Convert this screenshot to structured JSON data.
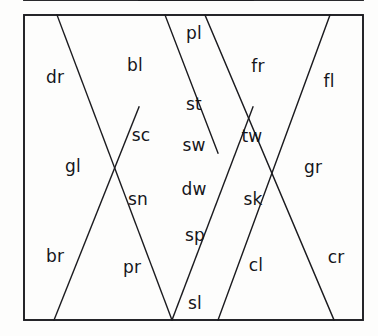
{
  "diagram": {
    "type": "line-lattice",
    "background_color": "#fdfdfc",
    "stroke_color": "#1b1b1f",
    "text_color": "#15151a",
    "frame": {
      "x": 24,
      "y": 15,
      "width": 339,
      "height": 305
    },
    "horizontal_rules": [
      {
        "name": "upper-band-divider",
        "y": 118,
        "x1": 24,
        "x2": 363
      },
      {
        "name": "lower-band-divider",
        "y": 213,
        "x1": 24,
        "x2": 363
      },
      {
        "name": "center-short-divider",
        "y": 166,
        "x1": 139,
        "x2": 253
      }
    ],
    "diagonals": [
      {
        "name": "diag-dr-bl",
        "x1": 57,
        "y1": 15,
        "x2": 172,
        "y2": 320
      },
      {
        "name": "diag-pl-st",
        "x1": 165,
        "y1": 15,
        "x2": 218,
        "y2": 153
      },
      {
        "name": "diag-sc-sn",
        "x1": 139,
        "y1": 107,
        "x2": 54,
        "y2": 320
      },
      {
        "name": "diag-fr-fl",
        "x1": 330,
        "y1": 15,
        "x2": 218,
        "y2": 320
      },
      {
        "name": "diag-tw-sk",
        "x1": 205,
        "y1": 15,
        "x2": 334,
        "y2": 320
      },
      {
        "name": "diag-sp-sl",
        "x1": 172,
        "y1": 320,
        "x2": 253,
        "y2": 107
      }
    ],
    "crossings": [
      {
        "name": "crossing-top",
        "x": 195,
        "y": 68
      },
      {
        "name": "crossing-left",
        "x": 139,
        "y": 166
      },
      {
        "name": "crossing-right",
        "x": 253,
        "y": 166
      },
      {
        "name": "crossing-bottom",
        "x": 195,
        "y": 265
      }
    ],
    "labels": [
      {
        "name": "cell-label-dr",
        "text": "dr",
        "x": 55,
        "y": 77,
        "size": 17
      },
      {
        "name": "cell-label-bl",
        "text": "bl",
        "x": 135,
        "y": 65,
        "size": 17
      },
      {
        "name": "cell-label-pl",
        "text": "pl",
        "x": 194,
        "y": 33,
        "size": 17
      },
      {
        "name": "cell-label-fr",
        "text": "fr",
        "x": 258,
        "y": 66,
        "size": 17
      },
      {
        "name": "cell-label-fl",
        "text": "fl",
        "x": 329,
        "y": 81,
        "size": 17
      },
      {
        "name": "cell-label-st",
        "text": "st",
        "x": 194,
        "y": 104,
        "size": 17
      },
      {
        "name": "cell-label-sc",
        "text": "sc",
        "x": 141,
        "y": 135,
        "size": 17
      },
      {
        "name": "cell-label-sw",
        "text": "sw",
        "x": 194,
        "y": 145,
        "size": 17
      },
      {
        "name": "cell-label-tw",
        "text": "tw",
        "x": 252,
        "y": 136,
        "size": 17
      },
      {
        "name": "cell-label-gl",
        "text": "gl",
        "x": 73,
        "y": 166,
        "size": 17
      },
      {
        "name": "cell-label-gr",
        "text": "gr",
        "x": 313,
        "y": 167,
        "size": 17
      },
      {
        "name": "cell-label-dw",
        "text": "dw",
        "x": 194,
        "y": 189,
        "size": 17
      },
      {
        "name": "cell-label-sn",
        "text": "sn",
        "x": 138,
        "y": 199,
        "size": 17
      },
      {
        "name": "cell-label-sk",
        "text": "sk",
        "x": 253,
        "y": 199,
        "size": 17
      },
      {
        "name": "cell-label-sp",
        "text": "sp",
        "x": 195,
        "y": 235,
        "size": 17
      },
      {
        "name": "cell-label-br",
        "text": "br",
        "x": 55,
        "y": 256,
        "size": 17
      },
      {
        "name": "cell-label-pr",
        "text": "pr",
        "x": 132,
        "y": 267,
        "size": 17
      },
      {
        "name": "cell-label-cl",
        "text": "cl",
        "x": 256,
        "y": 265,
        "size": 17
      },
      {
        "name": "cell-label-cr",
        "text": "cr",
        "x": 336,
        "y": 257,
        "size": 17
      },
      {
        "name": "cell-label-sl",
        "text": "sl",
        "x": 195,
        "y": 303,
        "size": 17
      }
    ]
  }
}
